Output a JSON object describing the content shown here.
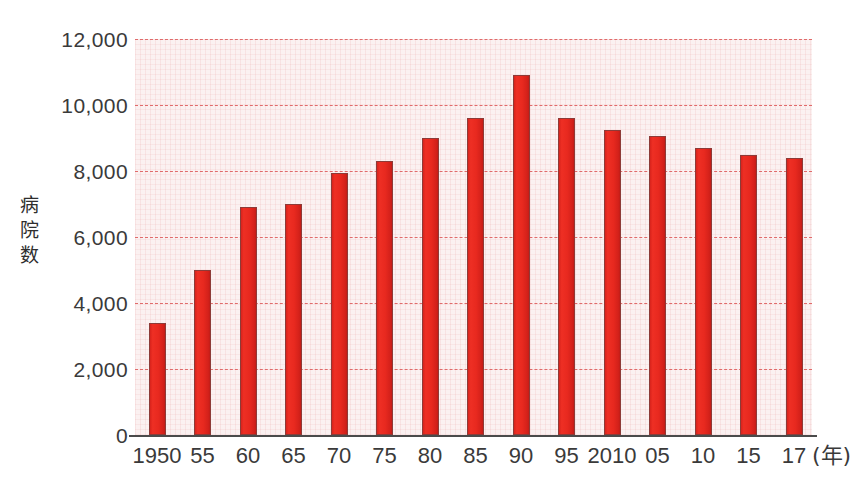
{
  "chart_data": {
    "type": "bar",
    "title": "",
    "subtitle": "",
    "xlabel": "年",
    "ylabel": "病院数",
    "categories": [
      "1950",
      "55",
      "60",
      "65",
      "70",
      "75",
      "80",
      "85",
      "90",
      "95",
      "2010",
      "05",
      "10",
      "15",
      "17"
    ],
    "values": [
      3400,
      5000,
      6900,
      7000,
      7950,
      8300,
      9000,
      9600,
      10900,
      9600,
      9250,
      9050,
      8700,
      8500,
      8400
    ],
    "ylim": [
      0,
      12000
    ],
    "ytick_values": [
      0,
      2000,
      4000,
      6000,
      8000,
      10000,
      12000
    ],
    "ytick_labels": [
      "0",
      "2,000",
      "4,000",
      "6,000",
      "8,000",
      "10,000",
      "12,000"
    ],
    "grid": true,
    "grid_style": "horizontal-dashed",
    "legend": "none",
    "bar_color": "#e8291f",
    "bar_edge_color": "#8d3b38",
    "gridline_color": "#e06b6b",
    "plot_background_color": "#fbf1f1",
    "axis_color": "#4b4b4b",
    "text_color": "#3a3a3a"
  },
  "axis": {
    "y_title_chars": [
      "病",
      "院",
      "数"
    ],
    "x_unit_text": "(年)"
  }
}
